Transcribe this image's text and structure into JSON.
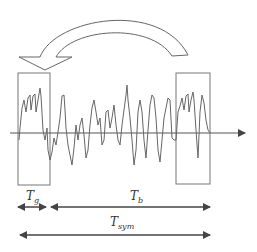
{
  "diagram": {
    "labels": {
      "guard": "T",
      "guard_sub": "g",
      "body": "T",
      "body_sub": "b",
      "symbol": "T",
      "symbol_sub": "sym"
    },
    "colors": {
      "stroke": "#555555",
      "box": "#777777",
      "text": "#333333"
    }
  }
}
